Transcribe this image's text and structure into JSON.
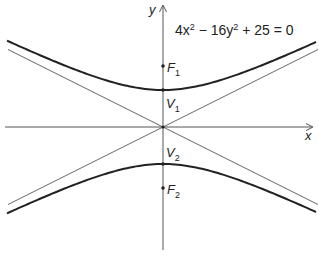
{
  "diagram": {
    "equation": "4x² − 16y² + 25 = 0",
    "equation_parts": {
      "a": "4x",
      "b": "2",
      "c": " − 16y",
      "d": "2",
      "e": " + 25 = 0"
    },
    "axes": {
      "x_label": "x",
      "y_label": "y"
    },
    "points": {
      "F1": {
        "name": "F",
        "sub": "1"
      },
      "V1": {
        "name": "V",
        "sub": "1"
      },
      "V2": {
        "name": "V",
        "sub": "2"
      },
      "F2": {
        "name": "F",
        "sub": "2"
      }
    },
    "asymptotes": [
      "y = x/2",
      "y = −x/2"
    ],
    "colors": {
      "curve": "#222222",
      "axis": "#555555",
      "asymptote": "#555555"
    }
  }
}
